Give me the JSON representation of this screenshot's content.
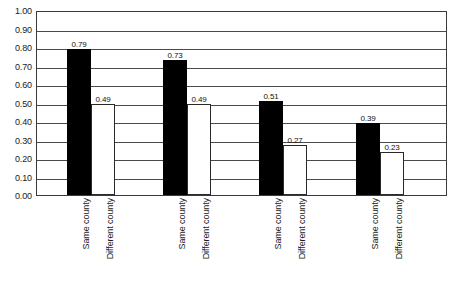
{
  "chart_data": {
    "type": "bar",
    "title": "",
    "subtitle": "",
    "xlabel": "",
    "ylabel": "",
    "ylim": [
      0.0,
      1.0
    ],
    "ytick_step": 0.1,
    "ytick_labels": [
      "1.00",
      "0.90",
      "0.80",
      "0.70",
      "0.60",
      "0.50",
      "0.40",
      "0.30",
      "0.20",
      "0.10",
      "0.00"
    ],
    "ytick_values": [
      1.0,
      0.9,
      0.8,
      0.7,
      0.6,
      0.5,
      0.4,
      0.3,
      0.2,
      0.1,
      0.0
    ],
    "grid": "horizontal",
    "legend": "none",
    "categories": [
      "Same county",
      "Different county"
    ],
    "groups": [
      {
        "bars": [
          {
            "category": "Same county",
            "value": 0.79,
            "label": "0.79",
            "style": "dark"
          },
          {
            "category": "Different county",
            "value": 0.49,
            "label": "0.49",
            "style": "light"
          }
        ]
      },
      {
        "bars": [
          {
            "category": "Same county",
            "value": 0.73,
            "label": "0.73",
            "style": "dark"
          },
          {
            "category": "Different county",
            "value": 0.49,
            "label": "0.49",
            "style": "light"
          }
        ]
      },
      {
        "bars": [
          {
            "category": "Same county",
            "value": 0.51,
            "label": "0.51",
            "style": "dark"
          },
          {
            "category": "Different county",
            "value": 0.27,
            "label": "0.27",
            "style": "light"
          }
        ]
      },
      {
        "bars": [
          {
            "category": "Same county",
            "value": 0.39,
            "label": "0.39",
            "style": "dark"
          },
          {
            "category": "Different county",
            "value": 0.23,
            "label": "0.23",
            "style": "light"
          }
        ]
      }
    ],
    "colors": {
      "series_same_county": "#000000",
      "series_different_county": "#ffffff",
      "bar_outline": "#2a2a2a",
      "gridline": "#4a4a4a",
      "frame": "#3a3a3a",
      "text": "#1a1a1a",
      "background": "#ffffff"
    }
  },
  "layout": {
    "plot": {
      "left": 36,
      "top": 11,
      "width": 411,
      "height": 185
    },
    "bar_width": 24,
    "group_positions": [
      66,
      162,
      258,
      355
    ]
  }
}
